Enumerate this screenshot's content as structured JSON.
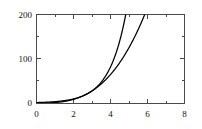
{
  "chart_data": {
    "type": "line",
    "title": "",
    "subtitle": "",
    "xlabel": "",
    "ylabel": "",
    "xlim": [
      0,
      8
    ],
    "ylim": [
      0,
      200
    ],
    "grid": false,
    "legend": null,
    "x_ticks_major": [
      0,
      2,
      4,
      6,
      8
    ],
    "x_ticks_minor": [
      1,
      3,
      5,
      7
    ],
    "x_tick_labels": [
      "0",
      "2",
      "4",
      "6",
      "8"
    ],
    "y_ticks_major": [
      0,
      100,
      200
    ],
    "y_ticks_minor": [
      50,
      150
    ],
    "y_tick_labels": [
      "0",
      "100",
      "200"
    ],
    "frame": "box",
    "tick_direction": "in",
    "axis_color": "#4a4a4a",
    "curve_color": "#000000",
    "x": [
      0,
      0.5,
      1,
      1.5,
      2,
      2.5,
      3,
      3.5,
      4,
      4.5,
      5,
      5.5,
      6,
      6.5,
      7,
      7.5,
      8
    ],
    "series": [
      {
        "name": "cubic",
        "expression": "x^3",
        "clipped_at_top": true,
        "values": [
          0,
          0.13,
          1,
          3.38,
          8,
          15.63,
          27,
          42.88,
          64,
          91.13,
          125,
          166.38,
          216,
          274.63,
          343,
          421.88,
          512
        ]
      },
      {
        "name": "exponential",
        "expression": "3^x",
        "clipped_at_top": false,
        "values": [
          1,
          1.73,
          3,
          5.2,
          9,
          15.59,
          27,
          46.77,
          81,
          140.3,
          243,
          420.9,
          729,
          1262.7,
          2187,
          3788,
          6561
        ]
      }
    ],
    "annotations": [
      {
        "text": "curves intersect",
        "x": 7,
        "y": 145
      }
    ]
  },
  "axes_geometry": {
    "left_px": 36,
    "right_px": 185,
    "top_px": 14,
    "bottom_px": 103
  }
}
